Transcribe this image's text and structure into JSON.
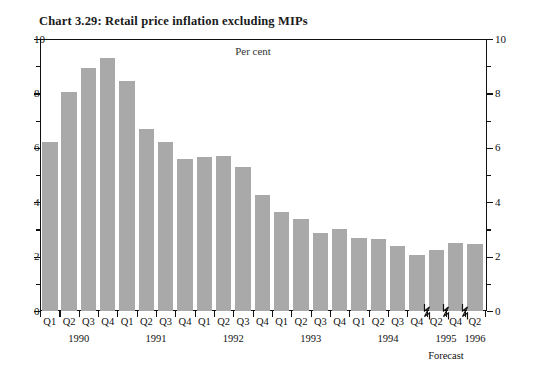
{
  "chart_data": {
    "type": "bar",
    "title": "Chart 3.29: Retail price inflation excluding MIPs",
    "units_label": "Per cent",
    "xlabel": "",
    "ylabel": "",
    "ylim": [
      0,
      10
    ],
    "y_ticks_major": [
      0,
      2,
      4,
      6,
      8,
      10
    ],
    "y_ticks_minor": [
      1,
      3,
      5,
      7,
      9
    ],
    "y_tick_labels_left": [
      "0",
      "2",
      "4",
      "6",
      "8",
      "10"
    ],
    "y_tick_labels_right": [
      "0",
      "2",
      "4",
      "6",
      "8",
      "10"
    ],
    "grid": false,
    "legend": false,
    "bar_color": "#a9a9a9",
    "axis_color": "#111111",
    "categories": [
      "Q1",
      "Q2",
      "Q3",
      "Q4",
      "Q1",
      "Q2",
      "Q3",
      "Q4",
      "Q1",
      "Q2",
      "Q3",
      "Q4",
      "Q1",
      "Q2",
      "Q3",
      "Q4",
      "Q1",
      "Q2",
      "Q3",
      "Q4",
      "Q2",
      "Q4",
      "Q2"
    ],
    "values": [
      6.2,
      8.05,
      8.95,
      9.3,
      8.45,
      6.7,
      6.2,
      5.6,
      5.65,
      5.7,
      5.3,
      4.25,
      3.65,
      3.4,
      2.85,
      3.0,
      2.7,
      2.65,
      2.4,
      2.05,
      2.25,
      2.5,
      2.45
    ],
    "year_groups": [
      {
        "label": "1990",
        "start_index": 0,
        "end_index": 3
      },
      {
        "label": "1991",
        "start_index": 4,
        "end_index": 7
      },
      {
        "label": "1992",
        "start_index": 8,
        "end_index": 11
      },
      {
        "label": "1993",
        "start_index": 12,
        "end_index": 15
      },
      {
        "label": "1994",
        "start_index": 16,
        "end_index": 19
      },
      {
        "label": "1995",
        "start_index": 20,
        "end_index": 21
      },
      {
        "label": "1996",
        "start_index": 22,
        "end_index": 22
      }
    ],
    "forecast_note": "Forecast",
    "axis_breaks_after_index": [
      19,
      20,
      21
    ]
  }
}
